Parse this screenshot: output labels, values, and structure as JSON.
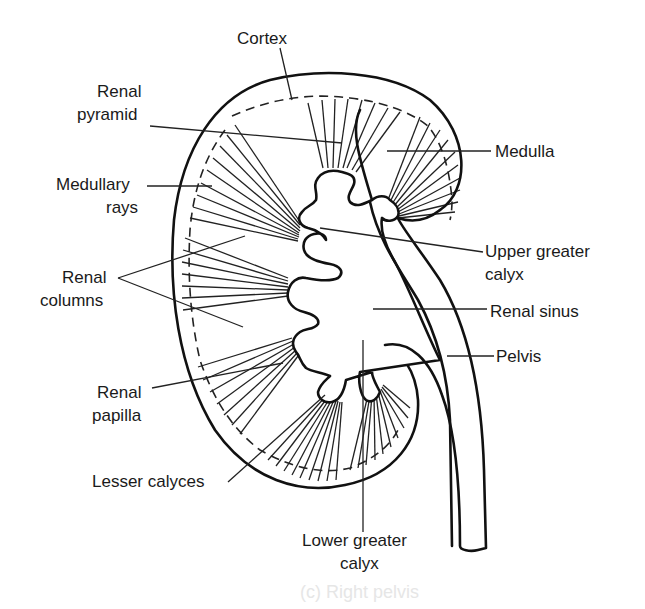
{
  "figure": {
    "labels": {
      "cortex": "Cortex",
      "renal_pyramid_1": "Renal",
      "renal_pyramid_2": "pyramid",
      "medulla": "Medulla",
      "medullary_rays_1": "Medullary",
      "medullary_rays_2": "rays",
      "upper_greater_calyx_1": "Upper greater",
      "upper_greater_calyx_2": "calyx",
      "renal_columns_1": "Renal",
      "renal_columns_2": "columns",
      "renal_sinus": "Renal sinus",
      "pelvis": "Pelvis",
      "renal_papilla_1": "Renal",
      "renal_papilla_2": "papilla",
      "lesser_calyces": "Lesser calyces",
      "lower_greater_calyx_1": "Lower greater",
      "lower_greater_calyx_2": "calyx"
    },
    "ghost_text": "(c) Right pelvis",
    "colors": {
      "line": "#111111",
      "text": "#1a1a1a",
      "background": "#ffffff"
    }
  }
}
